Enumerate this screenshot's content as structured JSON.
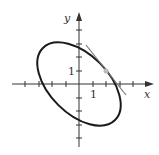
{
  "figure": {
    "x_axis_label": "x",
    "y_axis_label": "y",
    "x_tick_label": "1",
    "y_tick_label": "1",
    "curve": "ellipse x^2 + xy + y^2 = 7",
    "tangent_point": [
      2,
      1
    ],
    "tangent_slope": -1.25,
    "x_ticks": [
      -4,
      -3,
      -2,
      -1,
      1,
      2,
      3,
      4
    ],
    "y_ticks": [
      -4,
      -3,
      -2,
      -1,
      1,
      2,
      3
    ],
    "colors": {
      "curve": "#1a1a1a",
      "axis": "#333333",
      "tangent": "#777777",
      "point": "#bbbbbb"
    }
  }
}
